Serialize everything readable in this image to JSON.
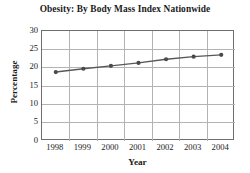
{
  "chart_data": {
    "type": "line",
    "title": "Obesity: By Body Mass Index Nationwide",
    "xlabel": "Year",
    "ylabel": "Percentage",
    "categories": [
      "1998",
      "1999",
      "2000",
      "2001",
      "2002",
      "2003",
      "2004"
    ],
    "x": [
      1998,
      1999,
      2000,
      2001,
      2002,
      2003,
      2004
    ],
    "values": [
      18.8,
      19.7,
      20.5,
      21.3,
      22.3,
      23.0,
      23.5
    ],
    "series": [
      {
        "name": "Obesity percentage",
        "values": [
          18.8,
          19.7,
          20.5,
          21.3,
          22.3,
          23.0,
          23.5
        ]
      }
    ],
    "ylim": [
      0,
      30
    ],
    "yticks": [
      0,
      5,
      10,
      15,
      20,
      25,
      30
    ],
    "ytick_labels": [
      "0",
      "5",
      "10",
      "15",
      "20",
      "25",
      "30"
    ],
    "xlim": [
      1997.5,
      2004.5
    ],
    "grid": true,
    "legend": false,
    "marker": "circle",
    "line_color": "#585858",
    "marker_color": "#4a4a4a",
    "grid_color": "#b3b3b3",
    "axis_color": "#6e6e6e",
    "background_color": "#ffffff"
  }
}
